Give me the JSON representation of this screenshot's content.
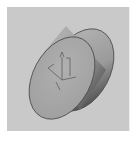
{
  "thumbnail": {
    "kind": "3d-model-preview",
    "object": "cylinder-disk",
    "colors": {
      "background": "#c9c9c9",
      "face": "#a9a9a9",
      "rim_light": "#b5b5b5",
      "rim_dark": "#5a5a5a",
      "edge": "#4a4a4a",
      "axes": "#6e6e6e"
    }
  }
}
